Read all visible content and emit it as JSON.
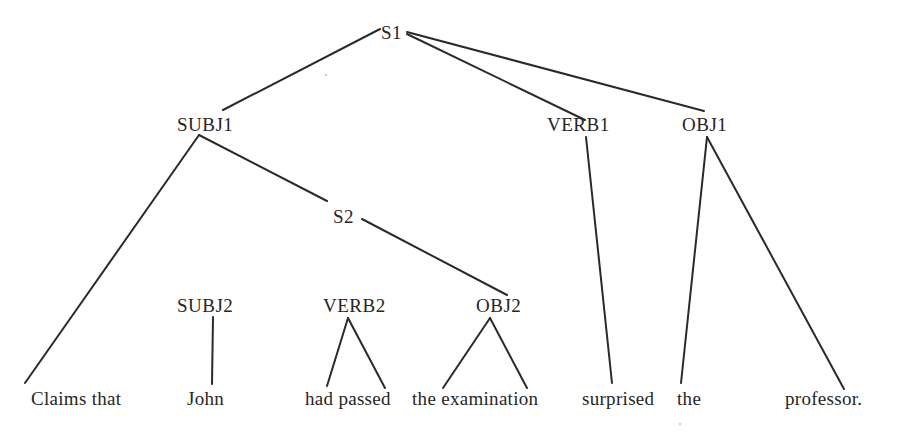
{
  "diagram": {
    "type": "syntax-tree",
    "nodes": {
      "s1": "S1",
      "subj1": "SUBJ1",
      "verb1": "VERB1",
      "obj1": "OBJ1",
      "s2": "S2",
      "subj2": "SUBJ2",
      "verb2": "VERB2",
      "obj2": "OBJ2"
    },
    "leaves": {
      "claims_that": "Claims that",
      "john": "John",
      "had_passed": "had passed",
      "the_examination": "the examination",
      "surprised": "surprised",
      "the": "the",
      "professor": "professor."
    },
    "edges": [
      [
        "S1",
        "SUBJ1"
      ],
      [
        "S1",
        "VERB1"
      ],
      [
        "S1",
        "OBJ1"
      ],
      [
        "SUBJ1",
        "Claims that"
      ],
      [
        "SUBJ1",
        "S2"
      ],
      [
        "S2",
        "OBJ2"
      ],
      [
        "SUBJ2",
        "John"
      ],
      [
        "VERB2",
        "had"
      ],
      [
        "VERB2",
        "passed"
      ],
      [
        "OBJ2",
        "the"
      ],
      [
        "OBJ2",
        "examination"
      ],
      [
        "VERB1",
        "surprised"
      ],
      [
        "OBJ1",
        "the"
      ],
      [
        "OBJ1",
        "professor."
      ]
    ],
    "sentence": "Claims that John had passed the examination surprised the professor."
  }
}
